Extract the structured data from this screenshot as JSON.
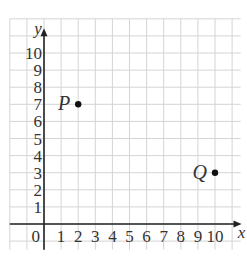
{
  "diagram": {
    "type": "coordinate-grid",
    "grid": {
      "origin_px": [
        44,
        224
      ],
      "unit_px": 17.1,
      "x_min_units": -2,
      "x_max_units": 11.5,
      "y_min_units": -1.5,
      "y_max_units": 12,
      "line_color": "#d4d4d4",
      "axis_color": "#222222"
    },
    "axes": {
      "x_label": "x",
      "y_label": "y",
      "origin_label": "0",
      "x_ticks": [
        "1",
        "2",
        "3",
        "4",
        "5",
        "6",
        "7",
        "8",
        "9",
        "10"
      ],
      "y_ticks": [
        "1",
        "2",
        "3",
        "4",
        "5",
        "6",
        "7",
        "8",
        "9",
        "10"
      ]
    },
    "points": [
      {
        "label": "P",
        "x": 2,
        "y": 7
      },
      {
        "label": "Q",
        "x": 10,
        "y": 3
      }
    ]
  },
  "chart_data": {
    "type": "scatter",
    "title": "",
    "xlabel": "x",
    "ylabel": "y",
    "xlim": [
      0,
      10
    ],
    "ylim": [
      0,
      10
    ],
    "grid": true,
    "x_tick_labels": [
      "0",
      "1",
      "2",
      "3",
      "4",
      "5",
      "6",
      "7",
      "8",
      "9",
      "10"
    ],
    "y_tick_labels": [
      "1",
      "2",
      "3",
      "4",
      "5",
      "6",
      "7",
      "8",
      "9",
      "10"
    ],
    "series": [
      {
        "name": "points",
        "points": [
          {
            "label": "P",
            "x": 2,
            "y": 7
          },
          {
            "label": "Q",
            "x": 10,
            "y": 3
          }
        ]
      }
    ]
  }
}
